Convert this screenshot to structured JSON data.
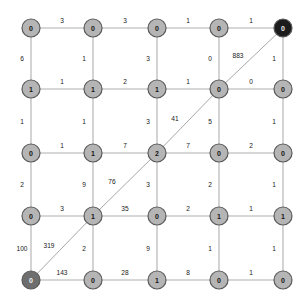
{
  "graph": {
    "type": "grid-graph",
    "rows": 5,
    "cols": 5,
    "node_radius": 9,
    "colors": {
      "node_normal": "#b5b5b5",
      "node_start": "#6e6e6e",
      "node_goal": "#1c1c1c",
      "edge": "#b0b0b0",
      "diagonal_edge": "#a8a8a8",
      "label_text": "#202020",
      "background": "#ffffff"
    },
    "node_positions": {
      "xs": [
        31,
        93,
        157,
        219,
        283
      ],
      "ys": [
        28,
        89,
        153,
        216,
        280
      ]
    },
    "node_labels": [
      [
        "0",
        "0",
        "0",
        "0",
        "0"
      ],
      [
        "1",
        "1",
        "1",
        "0",
        "0"
      ],
      [
        "0",
        "1",
        "2",
        "0",
        "0"
      ],
      [
        "0",
        "1",
        "0",
        "1",
        "1"
      ],
      [
        "0",
        "0",
        "1",
        "0",
        "0"
      ]
    ],
    "node_states": [
      [
        "normal",
        "normal",
        "normal",
        "normal",
        "goal"
      ],
      [
        "normal",
        "normal",
        "normal",
        "normal",
        "normal"
      ],
      [
        "normal",
        "normal",
        "normal",
        "normal",
        "normal"
      ],
      [
        "normal",
        "normal",
        "normal",
        "normal",
        "normal"
      ],
      [
        "start",
        "normal",
        "normal",
        "normal",
        "normal"
      ]
    ],
    "horizontal_edge_labels": [
      [
        "3",
        "3",
        "1",
        "1"
      ],
      [
        "1",
        "2",
        "1",
        "0"
      ],
      [
        "1",
        "7",
        "7",
        "2"
      ],
      [
        "3",
        "35",
        "2",
        "1"
      ],
      [
        "143",
        "28",
        "8",
        "1"
      ]
    ],
    "vertical_edge_labels": [
      [
        "6",
        "1",
        "3",
        "0",
        "1"
      ],
      [
        "1",
        "1",
        "3",
        "5",
        "1"
      ],
      [
        "2",
        "9",
        "3",
        "2",
        "1"
      ],
      [
        "100",
        "2",
        "9",
        "1",
        "1"
      ]
    ],
    "diagonal_path": {
      "description": "diagonal path from bottom-left start node to top-right goal node",
      "segment_labels": [
        "319",
        "76",
        "41",
        "883"
      ],
      "segments": [
        {
          "from": [
            4,
            0
          ],
          "to": [
            3,
            1
          ],
          "label": "319"
        },
        {
          "from": [
            3,
            1
          ],
          "to": [
            2,
            2
          ],
          "label": "76"
        },
        {
          "from": [
            2,
            2
          ],
          "to": [
            1,
            3
          ],
          "label": "41"
        },
        {
          "from": [
            1,
            3
          ],
          "to": [
            0,
            4
          ],
          "label": "883"
        }
      ]
    }
  }
}
